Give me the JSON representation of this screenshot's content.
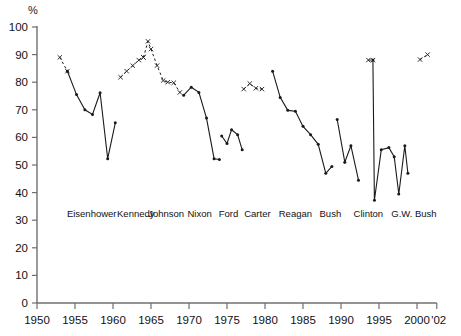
{
  "chart_data": {
    "type": "line",
    "title": "",
    "subtitle": "",
    "xlabel": "",
    "ylabel": "%",
    "ylim": [
      0,
      100
    ],
    "xlim": [
      1950,
      2002
    ],
    "grid": false,
    "legend": "none",
    "y_ticks": [
      0,
      10,
      20,
      30,
      40,
      50,
      60,
      70,
      80,
      90,
      100
    ],
    "x_ticks": [
      1950,
      1955,
      1960,
      1965,
      1970,
      1975,
      1980,
      1985,
      1990,
      1995,
      2000
    ],
    "x_end_label": "'02",
    "annotations": [
      {
        "text": "Eisenhower",
        "x": 1957.2,
        "y": 31
      },
      {
        "text": "Kennedy",
        "x": 1963.0,
        "y": 31
      },
      {
        "text": "Johnson",
        "x": 1967.0,
        "y": 31
      },
      {
        "text": "Nixon",
        "x": 1971.4,
        "y": 31
      },
      {
        "text": "Ford",
        "x": 1975.2,
        "y": 31
      },
      {
        "text": "Carter",
        "x": 1979.0,
        "y": 31
      },
      {
        "text": "Reagan",
        "x": 1984.0,
        "y": 31
      },
      {
        "text": "Bush",
        "x": 1988.6,
        "y": 31
      },
      {
        "text": "Clinton",
        "x": 1993.6,
        "y": 31
      },
      {
        "text": "G.W. Bush",
        "x": 1999.6,
        "y": 31
      }
    ],
    "series": [
      {
        "name": "Eisenhower",
        "style": "dashed",
        "marker": "x",
        "points": [
          [
            1953.0,
            89.0
          ],
          [
            1954.0,
            84.0
          ]
        ]
      },
      {
        "name": "Eisenhower-solid",
        "style": "solid",
        "marker": "dot",
        "points": [
          [
            1954.0,
            84.0
          ],
          [
            1955.2,
            75.5
          ],
          [
            1956.3,
            70.0
          ],
          [
            1957.3,
            68.3
          ],
          [
            1958.3,
            76.2
          ],
          [
            1959.3,
            52.3
          ],
          [
            1960.3,
            65.3
          ]
        ]
      },
      {
        "name": "Kennedy",
        "style": "dashed",
        "marker": "x",
        "points": [
          [
            1961.0,
            81.8
          ],
          [
            1961.8,
            84.0
          ],
          [
            1962.6,
            86.0
          ],
          [
            1963.4,
            88.0
          ],
          [
            1964.0,
            89.0
          ]
        ]
      },
      {
        "name": "Johnson",
        "style": "dashed",
        "marker": "x",
        "points": [
          [
            1964.0,
            89.0
          ],
          [
            1964.6,
            94.8
          ],
          [
            1965.0,
            92.0
          ],
          [
            1965.8,
            86.0
          ],
          [
            1966.6,
            80.6
          ],
          [
            1967.2,
            80.0
          ],
          [
            1968.0,
            79.8
          ],
          [
            1968.8,
            76.3
          ]
        ]
      },
      {
        "name": "Nixon",
        "style": "solid",
        "marker": "dot",
        "points": [
          [
            1969.3,
            75.3
          ],
          [
            1970.3,
            78.2
          ],
          [
            1971.3,
            76.3
          ],
          [
            1972.3,
            67.0
          ],
          [
            1973.3,
            52.3
          ],
          [
            1974.0,
            52.0
          ]
        ]
      },
      {
        "name": "Ford",
        "style": "solid",
        "marker": "dot",
        "points": [
          [
            1974.3,
            60.5
          ],
          [
            1975.0,
            57.8
          ],
          [
            1975.6,
            62.8
          ],
          [
            1976.4,
            61.0
          ],
          [
            1977.0,
            55.5
          ]
        ]
      },
      {
        "name": "Carter",
        "style": "dashed",
        "marker": "x",
        "points": [
          [
            1977.2,
            77.5
          ],
          [
            1978.0,
            79.5
          ],
          [
            1978.8,
            77.8
          ],
          [
            1979.6,
            77.5
          ]
        ]
      },
      {
        "name": "Reagan",
        "style": "solid",
        "marker": "dot",
        "points": [
          [
            1981.0,
            84.0
          ],
          [
            1982.0,
            74.5
          ],
          [
            1983.0,
            69.8
          ],
          [
            1984.0,
            69.5
          ],
          [
            1985.0,
            64.0
          ],
          [
            1986.0,
            61.0
          ],
          [
            1987.0,
            57.5
          ],
          [
            1988.0,
            47.0
          ],
          [
            1988.8,
            49.5
          ]
        ]
      },
      {
        "name": "Bush",
        "style": "solid",
        "marker": "dot",
        "points": [
          [
            1989.5,
            66.5
          ],
          [
            1990.5,
            51.0
          ],
          [
            1991.3,
            57.0
          ],
          [
            1992.3,
            44.5
          ]
        ]
      },
      {
        "name": "Clinton",
        "style": "solid",
        "marker": "dot",
        "points": [
          [
            1994.2,
            88.0
          ],
          [
            1994.4,
            37.2
          ],
          [
            1995.3,
            55.5
          ],
          [
            1996.3,
            56.3
          ],
          [
            1997.0,
            53.0
          ],
          [
            1997.6,
            39.5
          ],
          [
            1998.4,
            57.0
          ],
          [
            1998.8,
            47.0
          ]
        ]
      },
      {
        "name": "Clinton-dash-top",
        "style": "dashed",
        "marker": "x",
        "points": [
          [
            1993.6,
            88.0
          ],
          [
            1994.2,
            88.0
          ]
        ]
      },
      {
        "name": "G.W. Bush",
        "style": "dashed",
        "marker": "x",
        "points": [
          [
            2000.4,
            88.2
          ],
          [
            2001.4,
            90.0
          ]
        ]
      }
    ]
  }
}
